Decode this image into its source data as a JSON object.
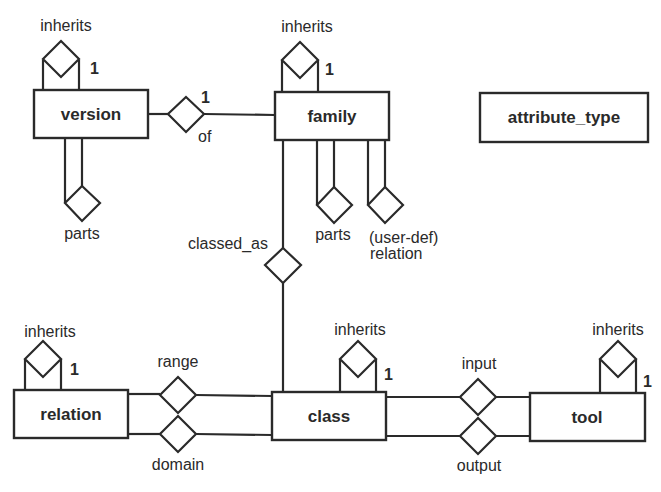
{
  "diagram": {
    "type": "entity-relationship",
    "colors": {
      "stroke": "#2a2a2a",
      "background": "#ffffff"
    },
    "entities": {
      "version": {
        "label": "version"
      },
      "family": {
        "label": "family"
      },
      "attribute_type": {
        "label": "attribute_type"
      },
      "relation": {
        "label": "relation"
      },
      "class": {
        "label": "class"
      },
      "tool": {
        "label": "tool"
      }
    },
    "relationships": {
      "version_inherits": {
        "label": "inherits",
        "cardinality": "1",
        "entity": "version"
      },
      "family_inherits": {
        "label": "inherits",
        "cardinality": "1",
        "entity": "family"
      },
      "relation_inherits": {
        "label": "inherits",
        "cardinality": "1",
        "entity": "relation"
      },
      "class_inherits": {
        "label": "inherits",
        "cardinality": "1",
        "entity": "class"
      },
      "tool_inherits": {
        "label": "inherits",
        "cardinality": "1",
        "entity": "tool"
      },
      "of": {
        "label": "of",
        "cardinality": "1",
        "from": "version",
        "to": "family"
      },
      "version_parts": {
        "label": "parts",
        "entity": "version"
      },
      "family_parts": {
        "label": "parts",
        "entity": "family"
      },
      "user_def": {
        "label_line1": "(user-def)",
        "label_line2": "relation",
        "entity": "family"
      },
      "classed_as": {
        "label": "classed_as",
        "from": "family",
        "to": "class"
      },
      "range": {
        "label": "range",
        "from": "relation",
        "to": "class"
      },
      "domain": {
        "label": "domain",
        "from": "relation",
        "to": "class"
      },
      "input": {
        "label": "input",
        "from": "class",
        "to": "tool"
      },
      "output": {
        "label": "output",
        "from": "class",
        "to": "tool"
      }
    }
  }
}
